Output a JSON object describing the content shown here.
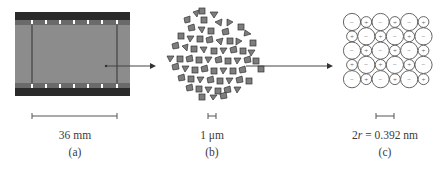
{
  "figure": {
    "panels": [
      {
        "id": "a",
        "label": "(a)",
        "scale_text": "36 mm",
        "subject": "film-strip"
      },
      {
        "id": "b",
        "label": "(b)",
        "scale_text": "1 μm",
        "subject": "grain-cluster"
      },
      {
        "id": "c",
        "label": "(c)",
        "scale_text_prefix": "2",
        "scale_text_var": "r",
        "scale_text_suffix": " = 0.392 nm",
        "subject": "ionic-lattice"
      }
    ],
    "lattice": {
      "rows": [
        [
          "-",
          "+",
          "-",
          "+",
          "-",
          "+"
        ],
        [
          "+",
          "-",
          "+",
          "-",
          "+",
          "-"
        ],
        [
          "-",
          "+",
          "-",
          "+",
          "-",
          "+"
        ],
        [
          "+",
          "-",
          "+",
          "-",
          "+",
          "-"
        ],
        [
          "-",
          "+",
          "-",
          "+",
          "-",
          "+"
        ]
      ]
    },
    "colors": {
      "film_dark": "#2a2a2a",
      "film_gray": "#8c8c8c",
      "grain_fill": "#7d7d7d",
      "line": "#444444"
    }
  }
}
